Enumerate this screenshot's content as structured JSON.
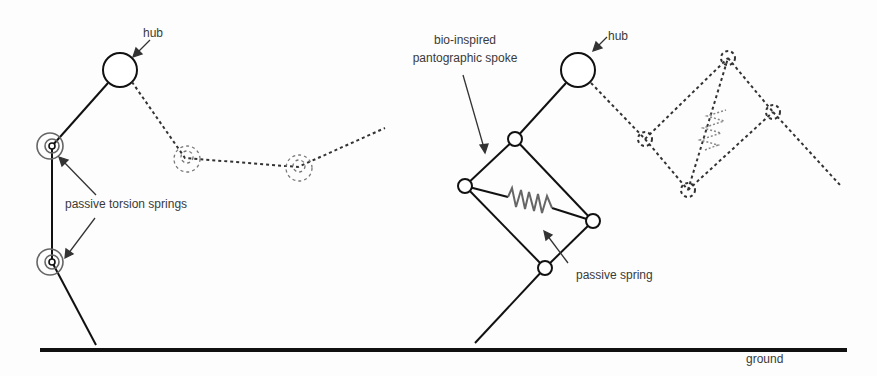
{
  "labels": {
    "hub_left": "hub",
    "passive_torsion_springs": "passive torsion springs",
    "hub_right": "hub",
    "spoke_line1": "bio-inspired",
    "spoke_line2": "pantographic spoke",
    "passive_spring": "passive spring",
    "ground": "ground"
  },
  "colors": {
    "line": "#111111",
    "spring": "#666666",
    "dashed": "#333333",
    "text": "#3a3a3a"
  }
}
